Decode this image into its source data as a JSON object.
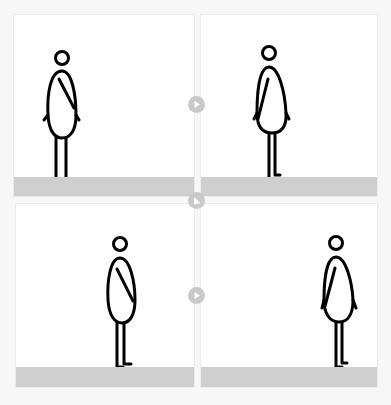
{
  "diagram": {
    "colors": {
      "background": "#f7f7f7",
      "panel": "#ffffff",
      "ground": "#cfcfcf",
      "arrow": "#c9c9c9",
      "stroke": "#000000"
    },
    "panels": [
      {
        "id": 1,
        "position": "top-left",
        "figure_x": 61,
        "arm": "right",
        "facing": "right"
      },
      {
        "id": 2,
        "position": "top-right",
        "figure_x": 268,
        "arm": "left",
        "facing": "right"
      },
      {
        "id": 3,
        "position": "bottom-left",
        "figure_x": 119,
        "arm": "right",
        "facing": "right"
      },
      {
        "id": 4,
        "position": "bottom-right",
        "figure_x": 335,
        "arm": "left",
        "facing": "right"
      }
    ],
    "arrows": [
      {
        "id": "arrow-1-2",
        "direction": "right"
      },
      {
        "id": "arrow-2-3",
        "direction": "down-left"
      },
      {
        "id": "arrow-3-4",
        "direction": "right"
      }
    ]
  }
}
